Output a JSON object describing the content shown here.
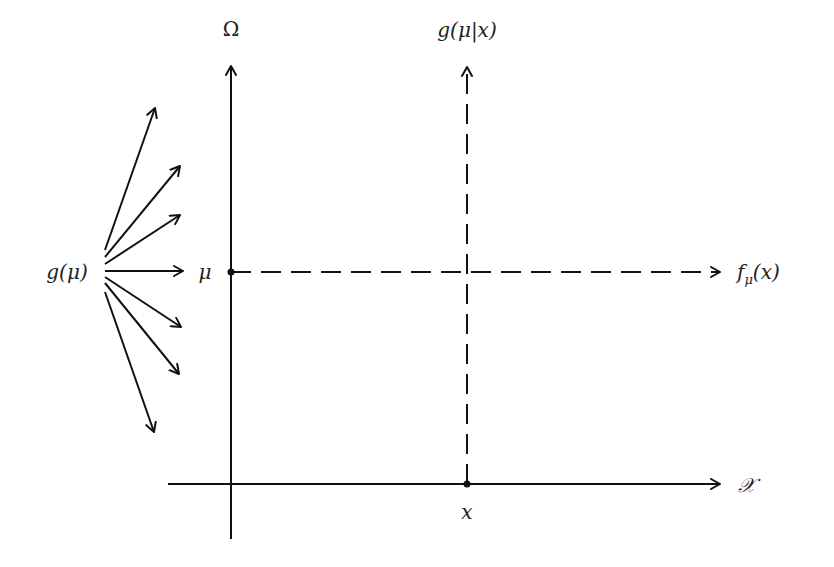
{
  "labels": {
    "omega": "Ω",
    "g_mu_given_x": "g(μ|x)",
    "g_mu": "g(μ)",
    "mu": "μ",
    "f_mu_x_f": "f",
    "f_mu_x_sub": "μ",
    "f_mu_x_rest": "(x)",
    "x_space": "𝒳",
    "x": "x"
  },
  "colors": {
    "stroke": "#111111",
    "text": "#222222",
    "background": "#ffffff"
  },
  "diagram": {
    "axes": {
      "vertical": {
        "label": "Ω",
        "x": 231,
        "y_top": 64,
        "y_bottom": 539
      },
      "horizontal": {
        "label": "𝒳",
        "y": 484,
        "x_left": 168,
        "x_right": 722
      }
    },
    "points": [
      {
        "name": "mu",
        "x": 231,
        "y": 272,
        "label": "μ"
      },
      {
        "name": "x",
        "x": 467,
        "y": 484,
        "label": "x"
      }
    ],
    "dashed_lines": [
      {
        "from": [
          231,
          272
        ],
        "to": [
          722,
          272
        ],
        "label": "f_μ(x)"
      },
      {
        "from": [
          467,
          484
        ],
        "to": [
          467,
          64
        ],
        "label": "g(μ|x)"
      }
    ],
    "prior_arrows": {
      "source_label": "g(μ)",
      "count": 7
    }
  }
}
